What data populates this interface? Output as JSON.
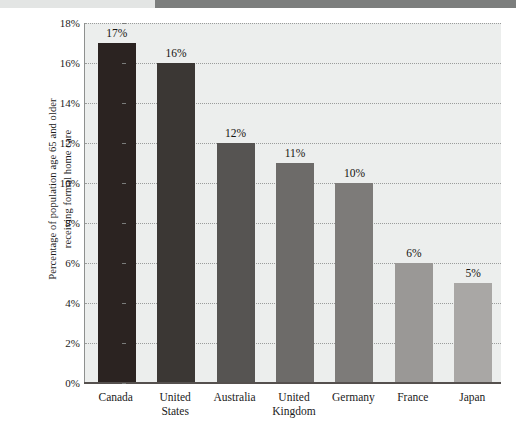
{
  "figure": {
    "y_axis_title_line1": "Percentage of population age 65 and older",
    "y_axis_title_line2": "receiving formal home care"
  },
  "chart_data": {
    "type": "bar",
    "title": "",
    "xlabel": "",
    "ylabel": "Percentage of population age 65 and older receiving formal home care",
    "categories": [
      "Canada",
      "United States",
      "Australia",
      "United Kingdom",
      "Germany",
      "France",
      "Japan"
    ],
    "category_lines": [
      [
        "Canada"
      ],
      [
        "United",
        "States"
      ],
      [
        "Australia"
      ],
      [
        "United",
        "Kingdom"
      ],
      [
        "Germany"
      ],
      [
        "France"
      ],
      [
        "Japan"
      ]
    ],
    "values": [
      17,
      16,
      12,
      11,
      10,
      6,
      5
    ],
    "value_labels": [
      "17%",
      "16%",
      "12%",
      "11%",
      "10%",
      "6%",
      "5%"
    ],
    "bar_colors": [
      "#2b2321",
      "#3b3734",
      "#565452",
      "#6d6b69",
      "#7d7b79",
      "#9a9896",
      "#a9a7a5"
    ],
    "ylim": [
      0,
      18
    ],
    "ytick_values": [
      0,
      2,
      4,
      6,
      8,
      10,
      12,
      14,
      16,
      18
    ],
    "ytick_labels": [
      "0%",
      "2%",
      "4%",
      "6%",
      "8%",
      "10%",
      "12%",
      "14%",
      "16%",
      "18%"
    ],
    "grid": true,
    "grid_axis": "y",
    "legend": "none",
    "plot_background": "#eceeed"
  }
}
